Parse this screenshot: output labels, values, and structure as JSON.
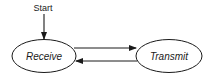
{
  "diagram": {
    "type": "state-machine",
    "start": {
      "label": "Start"
    },
    "states": [
      {
        "id": "receive",
        "label": "Receive"
      },
      {
        "id": "transmit",
        "label": "Transmit"
      }
    ],
    "transitions": [
      {
        "from": "start",
        "to": "receive"
      },
      {
        "from": "receive",
        "to": "transmit"
      },
      {
        "from": "transmit",
        "to": "receive"
      }
    ],
    "colors": {
      "stroke": "#1a1a1a",
      "background": "#ffffff"
    }
  }
}
